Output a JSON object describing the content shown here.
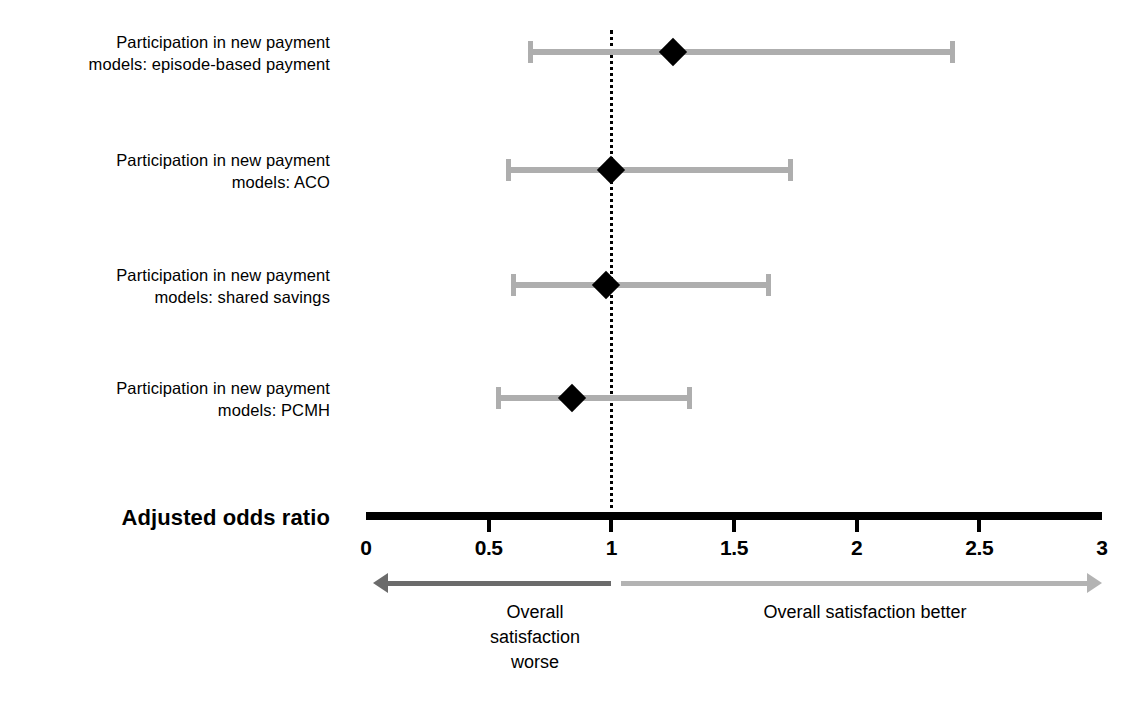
{
  "chart_data": {
    "type": "scatter",
    "subtype": "forest-plot",
    "title": "",
    "xlabel": "Adjusted odds ratio",
    "ylabel": "",
    "xlim": [
      0,
      3
    ],
    "grid": false,
    "reference_line": 1,
    "tick_labels": [
      "0",
      "0.5",
      "1",
      "1.5",
      "2",
      "2.5",
      "3"
    ],
    "tick_values": [
      0,
      0.5,
      1,
      1.5,
      2,
      2.5,
      3
    ],
    "categories": [
      "Participation in new payment\nmodels: episode-based payment",
      "Participation in new payment\nmodels: ACO",
      "Participation in new payment\nmodels: shared savings",
      "Participation in new payment\nmodels: PCMH"
    ],
    "values": [
      1.25,
      1.0,
      0.98,
      0.84
    ],
    "ci_low": [
      0.66,
      0.57,
      0.59,
      0.53
    ],
    "ci_high": [
      2.4,
      1.74,
      1.65,
      1.33
    ],
    "rows": [
      {
        "label": "Participation in new payment\nmodels: episode-based payment",
        "estimate": 1.25,
        "ci_low": 0.66,
        "ci_high": 2.4
      },
      {
        "label": "Participation in new payment\nmodels: ACO",
        "estimate": 1.0,
        "ci_low": 0.57,
        "ci_high": 1.74
      },
      {
        "label": "Participation in new payment\nmodels: shared savings",
        "estimate": 0.98,
        "ci_low": 0.59,
        "ci_high": 1.65
      },
      {
        "label": "Participation in new payment\nmodels: PCMH",
        "estimate": 0.84,
        "ci_low": 0.53,
        "ci_high": 1.33
      }
    ],
    "annotations": [
      {
        "name": "worse-direction",
        "text": "Overall\nsatisfaction\nworse",
        "direction": "left",
        "from": 1,
        "to": 0.03,
        "color": "#6b6b6b"
      },
      {
        "name": "better-direction",
        "text": "Overall satisfaction better",
        "direction": "right",
        "from": 1.04,
        "to": 3,
        "color": "#b3b3b3"
      }
    ],
    "colors": {
      "point": "#000000",
      "interval": "#aeaeae",
      "axis": "#000000",
      "reference": "#000000",
      "arrow_worse": "#6b6b6b",
      "arrow_better": "#b3b3b3",
      "background": "#ffffff"
    }
  }
}
